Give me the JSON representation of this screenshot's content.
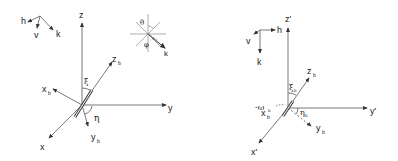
{
  "diagram": {
    "left_frame": {
      "orientation_triad": {
        "labels": [
          "h",
          "v",
          "k"
        ]
      },
      "axes": {
        "z": "z",
        "y": "y",
        "x": "x"
      },
      "body_axes": {
        "zb": "z",
        "zb_sub": "b",
        "xb": "x",
        "xb_sub": "b",
        "yb": "y",
        "yb_sub": "b"
      },
      "angles": {
        "xi": "ξ",
        "eta": "η"
      },
      "polar_inset": {
        "theta": "θ",
        "phi": "φ",
        "k": "k"
      }
    },
    "right_frame": {
      "orientation_triad": {
        "labels": [
          "h",
          "v",
          "k"
        ]
      },
      "axes": {
        "z": "z'",
        "y": "y'",
        "x": "x'"
      },
      "body_axes": {
        "zb": "z",
        "zb_sub": "b",
        "xb": "x",
        "xb_sub": "b",
        "yb": "y",
        "yb_sub": "b"
      },
      "angles": {
        "xi": "ξ",
        "xi_sub": "b",
        "eta": "η",
        "eta_sub": "b",
        "omega": "-ω",
        "omega_sub": "b"
      }
    },
    "colors": {
      "line": "#333333",
      "background": "#ffffff"
    }
  }
}
